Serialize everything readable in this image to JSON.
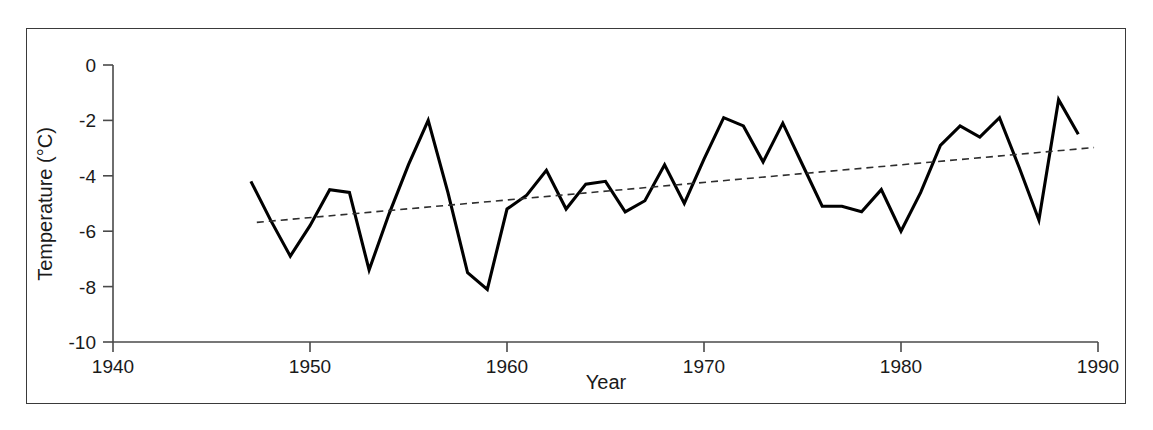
{
  "figure": {
    "frame_color": "#3a3a3a",
    "background": "#ffffff"
  },
  "axis": {
    "x_title": "Year",
    "y_title": "Temperature (°C)",
    "x_ticks": [
      "1940",
      "1950",
      "1960",
      "1970",
      "1980",
      "1990"
    ],
    "y_ticks": [
      "0",
      "-2",
      "-4",
      "-6",
      "-8",
      "-10"
    ]
  },
  "chart_data": {
    "type": "line",
    "title": "",
    "xlabel": "Year",
    "ylabel": "Temperature (°C)",
    "xlim": [
      1940,
      1990
    ],
    "ylim": [
      -10,
      0
    ],
    "xticks": [
      1940,
      1950,
      1960,
      1970,
      1980,
      1990
    ],
    "yticks": [
      -10,
      -8,
      -6,
      -4,
      -2,
      0
    ],
    "grid": false,
    "legend": false,
    "legend_position": "none",
    "series": [
      {
        "name": "Annual mean temperature",
        "style": "solid",
        "color": "#000000",
        "x": [
          1947,
          1948,
          1949,
          1950,
          1951,
          1952,
          1953,
          1954,
          1955,
          1956,
          1957,
          1958,
          1959,
          1960,
          1961,
          1962,
          1963,
          1964,
          1965,
          1966,
          1967,
          1968,
          1969,
          1970,
          1971,
          1972,
          1973,
          1974,
          1975,
          1976,
          1977,
          1978,
          1979,
          1980,
          1981,
          1982,
          1983,
          1984,
          1985,
          1986,
          1987,
          1988,
          1989
        ],
        "values": [
          -4.2,
          -5.6,
          -6.9,
          -5.8,
          -4.5,
          -4.6,
          -7.4,
          -5.4,
          -3.6,
          -2.0,
          -4.6,
          -7.5,
          -8.1,
          -5.2,
          -4.7,
          -3.8,
          -5.2,
          -4.3,
          -4.2,
          -5.3,
          -4.9,
          -3.6,
          -5.0,
          -3.4,
          -1.9,
          -2.2,
          -3.5,
          -2.1,
          -3.6,
          -5.1,
          -5.1,
          -5.3,
          -4.5,
          -6.0,
          -4.6,
          -2.9,
          -2.2,
          -2.6,
          -1.9,
          -3.7,
          -5.6,
          -1.25,
          -2.5
        ]
      },
      {
        "name": "Linear trend",
        "style": "dashed",
        "color": "#2e2e2e",
        "x": [
          1947.3,
          1989.8
        ],
        "values": [
          -5.68,
          -2.98
        ]
      }
    ]
  }
}
